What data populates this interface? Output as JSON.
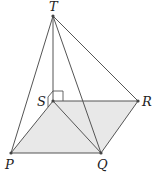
{
  "diagram": {
    "type": "pyramid",
    "colors": {
      "line": "#555555",
      "base_fill": "#e8e8e8",
      "point": "#444444",
      "label": "#222222"
    },
    "points": {
      "T": {
        "label": "T",
        "x": 53,
        "y": 16
      },
      "S": {
        "label": "S",
        "x": 53,
        "y": 101
      },
      "R": {
        "label": "R",
        "x": 138,
        "y": 101
      },
      "P": {
        "label": "P",
        "x": 11,
        "y": 153
      },
      "Q": {
        "label": "Q",
        "x": 101,
        "y": 153
      }
    },
    "edges": [
      "TP",
      "TS",
      "TQ",
      "TR",
      "PQ",
      "QR",
      "SR",
      "SP",
      "SQ"
    ],
    "right_angle_at": "S"
  }
}
